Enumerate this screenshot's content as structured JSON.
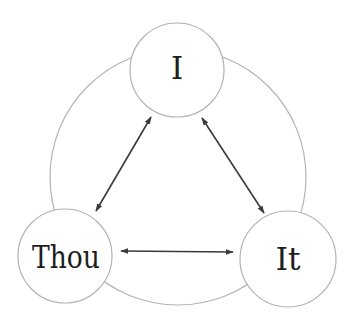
{
  "diagram": {
    "type": "relationship-triangle",
    "colors": {
      "background": "#ffffff",
      "circle_stroke": "#b3b3b3",
      "arrow_stroke": "#3a3a3a",
      "text": "#1e1e1e"
    },
    "outer_circle": {
      "cx": 178,
      "cy": 177,
      "r": 128
    },
    "nodes": [
      {
        "id": "i",
        "label": "I",
        "cx": 177,
        "cy": 70,
        "r": 47
      },
      {
        "id": "thou",
        "label": "Thou",
        "cx": 65,
        "cy": 256,
        "r": 47
      },
      {
        "id": "it",
        "label": "It",
        "cx": 288,
        "cy": 259,
        "r": 48
      }
    ],
    "edges": [
      {
        "from": "i",
        "to": "thou",
        "direction": "bidirectional"
      },
      {
        "from": "i",
        "to": "it",
        "direction": "bidirectional"
      },
      {
        "from": "thou",
        "to": "it",
        "direction": "bidirectional"
      }
    ]
  }
}
